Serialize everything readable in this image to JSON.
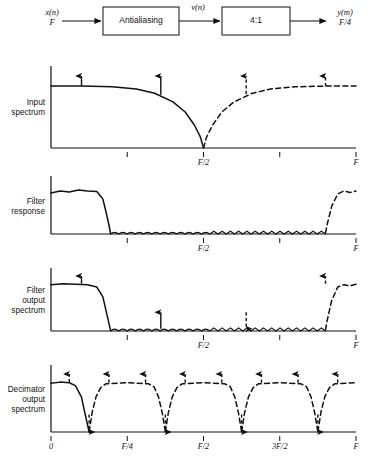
{
  "figure": {
    "chain": {
      "input_signal": "x(n)",
      "input_rate": "F",
      "block1": "Antialiasing",
      "mid_signal": "v(n)",
      "block2": "4:1",
      "output_signal": "y(m)",
      "output_rate": "F/4"
    },
    "panels": [
      {
        "id": "input-spectrum",
        "label_lines": [
          "Input",
          "spectrum"
        ],
        "ticks": [
          {
            "x": 0.25,
            "label": ""
          },
          {
            "x": 0.5,
            "label": "F/2"
          },
          {
            "x": 0.75,
            "label": ""
          },
          {
            "x": 1.0,
            "label": "F"
          }
        ]
      },
      {
        "id": "filter-response",
        "label_lines": [
          "Filter",
          "response"
        ],
        "ticks": [
          {
            "x": 0.25,
            "label": ""
          },
          {
            "x": 0.5,
            "label": "F/2"
          },
          {
            "x": 0.75,
            "label": ""
          },
          {
            "x": 1.0,
            "label": "F"
          }
        ]
      },
      {
        "id": "filter-output-spectrum",
        "label_lines": [
          "Filter",
          "output",
          "spectrum"
        ],
        "ticks": [
          {
            "x": 0.25,
            "label": ""
          },
          {
            "x": 0.5,
            "label": "F/2"
          },
          {
            "x": 0.75,
            "label": ""
          },
          {
            "x": 1.0,
            "label": "F"
          }
        ]
      },
      {
        "id": "decimator-output-spectrum",
        "label_lines": [
          "Decimator",
          "output",
          "spectrum"
        ],
        "ticks": [
          {
            "x": 0.0,
            "label": "0"
          },
          {
            "x": 0.25,
            "label": "F/4"
          },
          {
            "x": 0.5,
            "label": "F/2"
          },
          {
            "x": 0.75,
            "label": "3F/2"
          },
          {
            "x": 1.0,
            "label": "F"
          }
        ]
      }
    ]
  },
  "chart_data": {
    "type": "line",
    "title": "",
    "xlabel": "",
    "ylabel": "",
    "xlim": [
      0,
      1
    ],
    "ylim": [
      0,
      1
    ],
    "grid": false,
    "legend": "none",
    "axis_unit": "F (sampling frequency)",
    "panels": [
      {
        "name": "Input spectrum",
        "series": [
          {
            "name": "baseband image",
            "style": "solid",
            "x": [
              0.0,
              0.1,
              0.2,
              0.28,
              0.34,
              0.4,
              0.44,
              0.47,
              0.49,
              0.5
            ],
            "y": [
              0.86,
              0.86,
              0.85,
              0.82,
              0.76,
              0.64,
              0.5,
              0.32,
              0.15,
              0.0
            ]
          },
          {
            "name": "upper image",
            "style": "dashed",
            "x": [
              0.5,
              0.51,
              0.53,
              0.56,
              0.6,
              0.66,
              0.72,
              0.8,
              0.9,
              1.0
            ],
            "y": [
              0.0,
              0.15,
              0.32,
              0.5,
              0.64,
              0.76,
              0.82,
              0.85,
              0.86,
              0.86
            ]
          }
        ],
        "impulses": [
          {
            "x": 0.1,
            "base": 0.86,
            "top": 1.0,
            "style": "solid",
            "dir": "up"
          },
          {
            "x": 0.36,
            "base": 0.74,
            "top": 1.0,
            "style": "solid",
            "dir": "up"
          },
          {
            "x": 0.64,
            "base": 0.75,
            "top": 1.0,
            "style": "dashed",
            "dir": "up"
          },
          {
            "x": 0.9,
            "base": 0.86,
            "top": 1.0,
            "style": "dashed",
            "dir": "up"
          }
        ]
      },
      {
        "name": "Filter response",
        "series": [
          {
            "name": "lowpass passband",
            "style": "solid",
            "x": [
              0.0,
              0.03,
              0.06,
              0.09,
              0.12,
              0.15,
              0.17,
              0.18,
              0.19,
              0.195
            ],
            "y": [
              0.82,
              0.86,
              0.84,
              0.88,
              0.86,
              0.85,
              0.7,
              0.45,
              0.18,
              0.02
            ]
          },
          {
            "name": "stopband ripple",
            "style": "solid",
            "ripple": true,
            "x": [
              0.195,
              0.9
            ],
            "y": [
              0.035,
              0.035
            ]
          },
          {
            "name": "upper passband image",
            "style": "dashed",
            "x": [
              0.9,
              0.905,
              0.92,
              0.94,
              0.96,
              0.98,
              1.0
            ],
            "y": [
              0.02,
              0.18,
              0.55,
              0.8,
              0.86,
              0.83,
              0.86
            ]
          }
        ],
        "impulses": []
      },
      {
        "name": "Filter output spectrum",
        "series": [
          {
            "name": "filtered baseband",
            "style": "solid",
            "x": [
              0.0,
              0.04,
              0.08,
              0.12,
              0.15,
              0.17,
              0.18,
              0.19,
              0.195
            ],
            "y": [
              0.84,
              0.86,
              0.85,
              0.84,
              0.8,
              0.62,
              0.38,
              0.14,
              0.02
            ]
          },
          {
            "name": "attenuated stopband ripple",
            "style": "solid",
            "ripple": true,
            "x": [
              0.195,
              0.9
            ],
            "y": [
              0.035,
              0.035
            ]
          },
          {
            "name": "upper image",
            "style": "dashed",
            "x": [
              0.9,
              0.905,
              0.92,
              0.94,
              0.96,
              0.98,
              1.0
            ],
            "y": [
              0.02,
              0.18,
              0.55,
              0.8,
              0.84,
              0.82,
              0.85
            ]
          }
        ],
        "impulses": [
          {
            "x": 0.1,
            "base": 0.86,
            "top": 1.0,
            "style": "solid",
            "dir": "up"
          },
          {
            "x": 0.36,
            "base": 0.04,
            "top": 0.34,
            "style": "solid",
            "dir": "up"
          },
          {
            "x": 0.64,
            "base": 0.04,
            "top": 0.34,
            "style": "dashed",
            "dir": "down"
          },
          {
            "x": 0.9,
            "base": 0.86,
            "top": 1.0,
            "style": "dashed",
            "dir": "up"
          }
        ]
      },
      {
        "name": "Decimator output spectrum",
        "series": [
          {
            "name": "baseband lobe",
            "style": "solid",
            "x": [
              0.0,
              0.03,
              0.06,
              0.08,
              0.1,
              0.11,
              0.12,
              0.125
            ],
            "y": [
              0.84,
              0.86,
              0.85,
              0.8,
              0.6,
              0.35,
              0.12,
              0.0
            ]
          },
          {
            "name": "repeated images",
            "style": "dashed",
            "period": 0.25,
            "nulls": [
              0.125,
              0.375,
              0.625,
              0.875
            ],
            "plateau": 0.85
          }
        ],
        "impulses": [
          {
            "x": 0.06,
            "base": 0.86,
            "top": 1.0,
            "style": "dashed",
            "dir": "up"
          },
          {
            "x": 0.125,
            "base": 0.0,
            "top": 0.3,
            "style": "dashed",
            "dir": "down"
          },
          {
            "x": 0.19,
            "base": 0.85,
            "top": 1.0,
            "style": "dashed",
            "dir": "up"
          },
          {
            "x": 0.31,
            "base": 0.85,
            "top": 1.0,
            "style": "dashed",
            "dir": "up"
          },
          {
            "x": 0.375,
            "base": 0.0,
            "top": 0.3,
            "style": "dashed",
            "dir": "down"
          },
          {
            "x": 0.44,
            "base": 0.85,
            "top": 1.0,
            "style": "dashed",
            "dir": "up"
          },
          {
            "x": 0.56,
            "base": 0.85,
            "top": 1.0,
            "style": "dashed",
            "dir": "up"
          },
          {
            "x": 0.625,
            "base": 0.0,
            "top": 0.3,
            "style": "dashed",
            "dir": "down"
          },
          {
            "x": 0.69,
            "base": 0.85,
            "top": 1.0,
            "style": "dashed",
            "dir": "up"
          },
          {
            "x": 0.81,
            "base": 0.85,
            "top": 1.0,
            "style": "dashed",
            "dir": "up"
          },
          {
            "x": 0.875,
            "base": 0.0,
            "top": 0.3,
            "style": "dashed",
            "dir": "down"
          },
          {
            "x": 0.94,
            "base": 0.85,
            "top": 1.0,
            "style": "dashed",
            "dir": "up"
          }
        ]
      }
    ]
  }
}
